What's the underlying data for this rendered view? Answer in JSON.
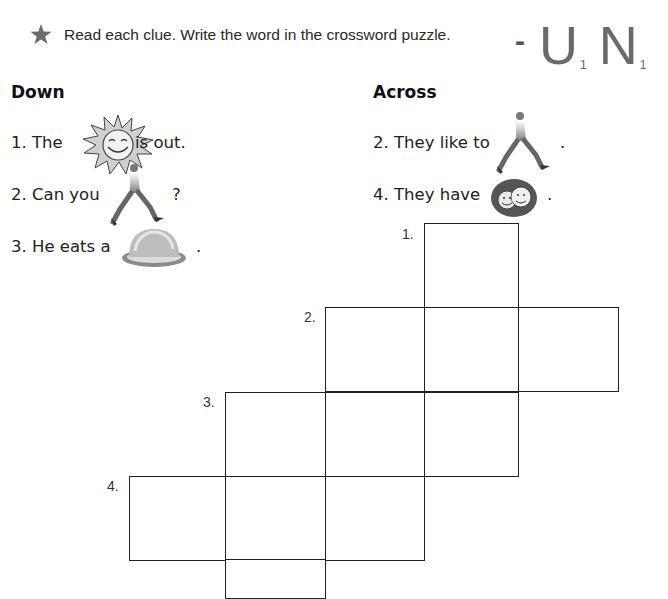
{
  "instruction": {
    "icon": "star-icon",
    "text": "Read each clue. Write the word in the crossword puzzle."
  },
  "logo": {
    "dash": "-",
    "tiles": [
      {
        "letter": "U",
        "score": "1"
      },
      {
        "letter": "N",
        "score": "1"
      }
    ]
  },
  "down": {
    "heading": "Down",
    "clues": [
      {
        "number": "1.",
        "before": "The",
        "image": "sun-icon",
        "after": "is out."
      },
      {
        "number": "2.",
        "before": "Can you",
        "image": "runner-icon",
        "after": "?"
      },
      {
        "number": "3.",
        "before": "He eats a",
        "image": "bun-icon",
        "after": "."
      }
    ]
  },
  "across": {
    "heading": "Across",
    "clues": [
      {
        "number": "2.",
        "before": "They like to",
        "image": "runner-icon",
        "after": "."
      },
      {
        "number": "4.",
        "before": "They have",
        "image": "happy-faces-icon",
        "after": "."
      }
    ]
  },
  "puzzle": {
    "numbers": [
      "1.",
      "2.",
      "3.",
      "4."
    ],
    "cells": [
      {
        "row": 0,
        "col": 3
      },
      {
        "row": 1,
        "col": 2
      },
      {
        "row": 1,
        "col": 3
      },
      {
        "row": 1,
        "col": 4
      },
      {
        "row": 2,
        "col": 1
      },
      {
        "row": 2,
        "col": 2
      },
      {
        "row": 2,
        "col": 3
      },
      {
        "row": 3,
        "col": 0
      },
      {
        "row": 3,
        "col": 1
      },
      {
        "row": 3,
        "col": 2
      },
      {
        "row": 4,
        "col": 1
      }
    ]
  }
}
